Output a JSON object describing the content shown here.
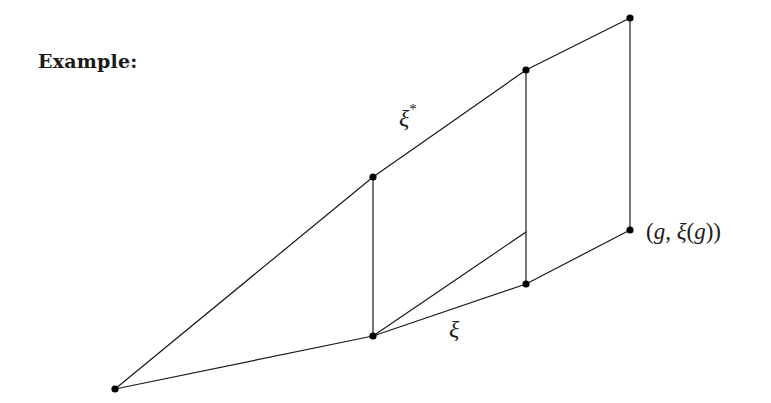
{
  "heading": "Example:",
  "labels": {
    "xi_star": "ξ",
    "xi_star_sup": "*",
    "xi": "ξ",
    "point_label": {
      "open1": "(",
      "g1": "g",
      "comma": ", ",
      "xi": "ξ",
      "open2": "(",
      "g2": "g",
      "close": "))"
    }
  },
  "colors": {
    "stroke": "#1a1a1a",
    "dot": "#000000",
    "background": "#ffffff"
  },
  "diagram": {
    "points": [
      {
        "id": "A",
        "x": 115,
        "y": 389
      },
      {
        "id": "B",
        "x": 373,
        "y": 177
      },
      {
        "id": "C",
        "x": 373,
        "y": 336
      },
      {
        "id": "D",
        "x": 526,
        "y": 70
      },
      {
        "id": "E",
        "x": 526,
        "y": 284
      },
      {
        "id": "F",
        "x": 630,
        "y": 18
      },
      {
        "id": "G",
        "x": 630,
        "y": 230
      }
    ],
    "segments": [
      [
        "A",
        "B"
      ],
      [
        "B",
        "D"
      ],
      [
        "D",
        "F"
      ],
      [
        "A",
        "C"
      ],
      [
        "C",
        "E"
      ],
      [
        "E",
        "G"
      ],
      [
        "B",
        "C"
      ],
      [
        "D",
        "E"
      ],
      [
        "F",
        "G"
      ],
      [
        "C",
        "H(526,232)"
      ]
    ]
  }
}
